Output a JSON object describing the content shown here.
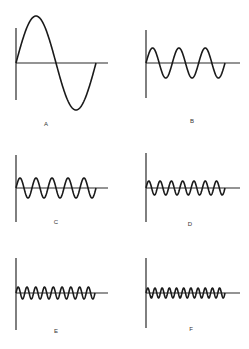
{
  "diagram": {
    "panels": [
      {
        "label": "A",
        "cycles": 1,
        "amplitude": 47,
        "axis_x": 16,
        "axis_top": 28,
        "axis_bottom": 100,
        "baseline_y": 63,
        "baseline_end": 108,
        "wave_end": 96,
        "label_x": 46,
        "label_y": 126
      },
      {
        "label": "B",
        "cycles": 3,
        "amplitude": 15,
        "axis_x": 146,
        "axis_top": 30,
        "axis_bottom": 98,
        "baseline_y": 63,
        "baseline_end": 240,
        "wave_end": 225,
        "label_x": 192,
        "label_y": 123
      },
      {
        "label": "C",
        "cycles": 5,
        "amplitude": 10,
        "axis_x": 16,
        "axis_top": 155,
        "axis_bottom": 222,
        "baseline_y": 188,
        "baseline_end": 108,
        "wave_end": 96,
        "label_x": 56,
        "label_y": 224
      },
      {
        "label": "D",
        "cycles": 7,
        "amplitude": 7,
        "axis_x": 146,
        "axis_top": 153,
        "axis_bottom": 222,
        "baseline_y": 188,
        "baseline_end": 240,
        "wave_end": 225,
        "label_x": 190,
        "label_y": 226
      },
      {
        "label": "E",
        "cycles": 9,
        "amplitude": 6,
        "axis_x": 16,
        "axis_top": 258,
        "axis_bottom": 330,
        "baseline_y": 293,
        "baseline_end": 108,
        "wave_end": 95,
        "label_x": 56,
        "label_y": 333
      },
      {
        "label": "F",
        "cycles": 11,
        "amplitude": 5,
        "axis_x": 146,
        "axis_top": 258,
        "axis_bottom": 328,
        "baseline_y": 293,
        "baseline_end": 240,
        "wave_end": 225,
        "label_x": 191,
        "label_y": 331
      }
    ]
  }
}
